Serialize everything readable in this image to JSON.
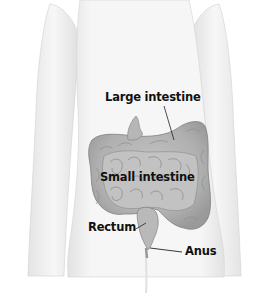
{
  "figure": {
    "colors": {
      "background": "#ffffff",
      "body_fill": "#f2f2f2",
      "body_shade": "#dcdcdc",
      "organ_fill": "#b8b8b8",
      "organ_shade": "#8e8e8e",
      "label_text": "#111111",
      "leader_line": "#222222"
    },
    "labels": [
      {
        "id": "large-intestine",
        "text": "Large intestine",
        "x": 105,
        "y": 92
      },
      {
        "id": "small-intestine",
        "text": "Small intestine",
        "x": 100,
        "y": 172
      },
      {
        "id": "rectum",
        "text": "Rectum",
        "x": 88,
        "y": 222
      },
      {
        "id": "anus",
        "text": "Anus",
        "x": 185,
        "y": 246
      }
    ]
  }
}
